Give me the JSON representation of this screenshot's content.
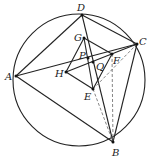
{
  "diagram": {
    "circle": {
      "cx": 79,
      "cy": 80,
      "r": 66
    },
    "points": {
      "A": [
        16,
        76
      ],
      "B": [
        113,
        142
      ],
      "C": [
        137,
        44
      ],
      "D": [
        82,
        15
      ],
      "E": [
        93,
        89
      ],
      "F": [
        112,
        54
      ],
      "G": [
        84,
        38
      ],
      "H": [
        66,
        72
      ],
      "P": [
        88,
        58
      ],
      "Q": [
        93,
        62
      ]
    },
    "labels": [
      {
        "text": "A",
        "x": 5,
        "y": 80
      },
      {
        "text": "B",
        "x": 112,
        "y": 156
      },
      {
        "text": "C",
        "x": 139,
        "y": 45
      },
      {
        "text": "D",
        "x": 77,
        "y": 11
      },
      {
        "text": "E",
        "x": 84,
        "y": 100
      },
      {
        "text": "F",
        "x": 113,
        "y": 64
      },
      {
        "text": "G",
        "x": 74,
        "y": 41
      },
      {
        "text": "H",
        "x": 55,
        "y": 77
      },
      {
        "text": "P",
        "x": 79,
        "y": 59
      },
      {
        "text": "Q",
        "x": 96,
        "y": 70
      }
    ],
    "solid_segments": [
      [
        "A",
        "D"
      ],
      [
        "D",
        "C"
      ],
      [
        "A",
        "C"
      ],
      [
        "A",
        "B"
      ],
      [
        "B",
        "C"
      ],
      [
        "D",
        "B"
      ],
      [
        "G",
        "E"
      ],
      [
        "G",
        "F"
      ],
      [
        "G",
        "H"
      ],
      [
        "H",
        "E"
      ],
      [
        "E",
        "F"
      ],
      [
        "H",
        "C"
      ]
    ],
    "dashed_segments": [
      [
        "C",
        "E"
      ],
      [
        "E",
        "B"
      ],
      [
        "F",
        "B"
      ]
    ]
  }
}
